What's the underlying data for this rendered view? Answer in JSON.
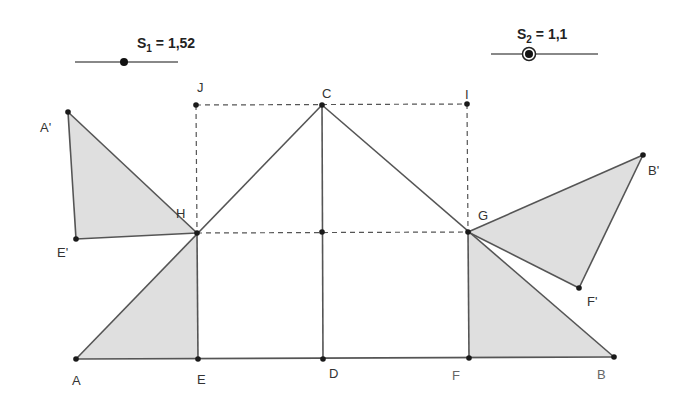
{
  "sliders": [
    {
      "name": "S",
      "index": "1",
      "value": "1,52",
      "eq": " = ",
      "line": {
        "x1": 75,
        "x2": 178,
        "y": 62
      },
      "knob": {
        "x": 124,
        "y": 62
      },
      "label_pos": {
        "x": 137,
        "y": 36
      },
      "selected": false
    },
    {
      "name": "S",
      "index": "2",
      "value": "1,1",
      "eq": " = ",
      "line": {
        "x1": 491,
        "x2": 598,
        "y": 54
      },
      "knob": {
        "x": 529,
        "y": 54
      },
      "label_pos": {
        "x": 517,
        "y": 27
      },
      "selected": true
    }
  ],
  "points": {
    "A": {
      "label": "A",
      "x": 76,
      "y": 359,
      "lx": 72,
      "ly": 374
    },
    "E": {
      "label": "E",
      "x": 198,
      "y": 359,
      "lx": 197,
      "ly": 373
    },
    "D": {
      "label": "D",
      "x": 323,
      "y": 359,
      "lx": 329,
      "ly": 367
    },
    "F": {
      "label": "F",
      "x": 469,
      "y": 358,
      "lx": 452,
      "ly": 369
    },
    "B": {
      "label": "B",
      "x": 614,
      "y": 357,
      "lx": 597,
      "ly": 368
    },
    "C": {
      "label": "C",
      "x": 322,
      "y": 105,
      "lx": 322,
      "ly": 87
    },
    "J": {
      "label": "J",
      "x": 196,
      "y": 105,
      "lx": 197,
      "ly": 81
    },
    "I": {
      "label": "I",
      "x": 467,
      "y": 104,
      "lx": 465,
      "ly": 88
    },
    "H": {
      "label": "H",
      "x": 197,
      "y": 233,
      "lx": 176,
      "ly": 207
    },
    "G": {
      "label": "G",
      "x": 468,
      "y": 232,
      "lx": 478,
      "ly": 209
    },
    "M": {
      "label": "",
      "x": 322,
      "y": 232,
      "lx": 0,
      "ly": 0
    },
    "A'": {
      "label": "A'",
      "x": 68,
      "y": 112,
      "lx": 40,
      "ly": 121
    },
    "E'": {
      "label": "E'",
      "x": 76,
      "y": 239,
      "lx": 57,
      "ly": 246
    },
    "B'": {
      "label": "B'",
      "x": 643,
      "y": 155,
      "lx": 648,
      "ly": 164
    },
    "F'": {
      "label": "F'",
      "x": 579,
      "y": 288,
      "lx": 587,
      "ly": 295
    }
  },
  "colors": {
    "stroke": "#555555",
    "point": "#1a1a1a",
    "fill": "#d9d9d9",
    "slider_line": "#888888",
    "dash": "#555555"
  }
}
